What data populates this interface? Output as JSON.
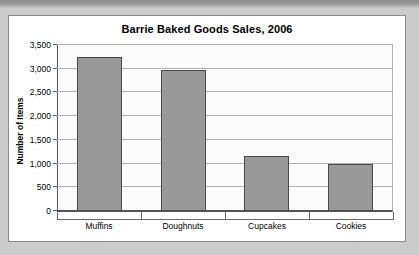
{
  "caption": {
    "text": "Created Bar Chart for Barrie Baked Goods Sales"
  },
  "chart_data": {
    "type": "bar",
    "title": "Barrie Baked Goods Sales, 2006",
    "xlabel": "",
    "ylabel": "Number of Items",
    "categories": [
      "Muffins",
      "Doughnuts",
      "Cupcakes",
      "Cookies"
    ],
    "values": [
      3250,
      2975,
      1150,
      1000
    ],
    "ylim": [
      0,
      3500
    ],
    "ytick_step": 500,
    "ytick_labels": [
      "3,500",
      "3,000",
      "2,500",
      "2,000",
      "1,500",
      "1,000",
      "500",
      "0"
    ],
    "ytick_values": [
      3500,
      3000,
      2500,
      2000,
      1500,
      1000,
      500,
      0
    ],
    "grid": true,
    "legend": "none",
    "series": [
      {
        "name": "Number of Items",
        "values": [
          3250,
          2975,
          1150,
          1000
        ],
        "color": "#999999"
      }
    ],
    "colors": {
      "bar_fill": "#999999",
      "bar_border": "#4a4a4a",
      "plot_background": "#fbfbfb",
      "gridline": "#b0b0b0",
      "axis": "#555555",
      "panel_background": "#ffffff",
      "page_background": "#cbcbcb"
    }
  }
}
